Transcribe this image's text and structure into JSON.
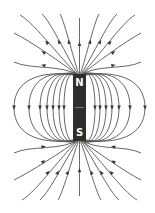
{
  "diagram": {
    "magnet": {
      "north_label": "N",
      "south_label": "S",
      "color": "#2e2e2e",
      "label_color": "#ffffff"
    },
    "field_line_color": "#555555",
    "arrow_color": "#3a3a3a",
    "field_direction": "out of N pole, into S pole",
    "loop_count_each_side": 7,
    "open_lines_top": 13,
    "open_lines_bottom": 13
  }
}
